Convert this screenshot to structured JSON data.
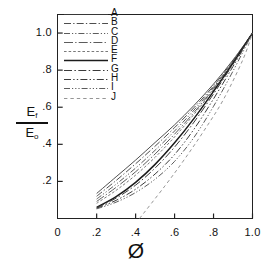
{
  "chart_data": {
    "type": "line",
    "title": "",
    "xlabel": "Ø",
    "ylabel": "E_f / E_o",
    "ylabel_numerator": "E",
    "ylabel_numerator_sub": "f",
    "ylabel_denominator": "E",
    "ylabel_denominator_sub": "o",
    "xlim": [
      0.0,
      1.0
    ],
    "ylim": [
      0.0,
      1.1
    ],
    "grid": false,
    "legend_position": "top-left-inside",
    "xticks": [
      0.0,
      0.2,
      0.4,
      0.6,
      0.8,
      1.0
    ],
    "xticklabels": [
      "0",
      ".2",
      ".4",
      ".6",
      ".8",
      "1.0"
    ],
    "yticks": [
      0.2,
      0.4,
      0.6,
      0.8,
      1.0
    ],
    "yticklabels": [
      ".2",
      ".4",
      ".6",
      ".8",
      "1.0"
    ],
    "series": [
      {
        "name": "A",
        "label": "A",
        "dash": "solid",
        "color": "#3a3a3a",
        "width": 0.9,
        "x": [
          0.2,
          0.3,
          0.4,
          0.5,
          0.6,
          0.7,
          0.8,
          0.9,
          1.0
        ],
        "y": [
          0.135,
          0.225,
          0.315,
          0.41,
          0.505,
          0.61,
          0.725,
          0.855,
          1.0
        ]
      },
      {
        "name": "B",
        "label": "B",
        "dash": "dash-dot",
        "color": "#3a3a3a",
        "width": 0.9,
        "x": [
          0.2,
          0.3,
          0.4,
          0.5,
          0.6,
          0.7,
          0.8,
          0.9,
          1.0
        ],
        "y": [
          0.12,
          0.205,
          0.295,
          0.39,
          0.49,
          0.598,
          0.715,
          0.85,
          1.0
        ]
      },
      {
        "name": "C",
        "label": "C",
        "dash": "dash-dot-dot",
        "color": "#4a4a4a",
        "width": 0.9,
        "x": [
          0.2,
          0.3,
          0.4,
          0.5,
          0.6,
          0.7,
          0.8,
          0.9,
          1.0
        ],
        "y": [
          0.105,
          0.185,
          0.272,
          0.368,
          0.472,
          0.585,
          0.708,
          0.845,
          1.0
        ]
      },
      {
        "name": "D",
        "label": "D",
        "dash": "long-dash-dot",
        "color": "#4a4a4a",
        "width": 0.9,
        "x": [
          0.2,
          0.3,
          0.4,
          0.5,
          0.6,
          0.7,
          0.8,
          0.9,
          1.0
        ],
        "y": [
          0.092,
          0.168,
          0.252,
          0.348,
          0.455,
          0.572,
          0.7,
          0.842,
          1.0
        ]
      },
      {
        "name": "E",
        "label": "E",
        "dash": "fine-dash",
        "color": "#6a6a6a",
        "width": 0.9,
        "x": [
          0.2,
          0.3,
          0.4,
          0.5,
          0.6,
          0.7,
          0.8,
          0.9,
          1.0
        ],
        "y": [
          0.082,
          0.152,
          0.234,
          0.33,
          0.44,
          0.562,
          0.695,
          0.84,
          1.0
        ]
      },
      {
        "name": "F",
        "label": "F",
        "dash": "solid-thick",
        "color": "#1c1c1c",
        "width": 1.5,
        "x": [
          0.2,
          0.3,
          0.4,
          0.5,
          0.6,
          0.7,
          0.8,
          0.9,
          1.0
        ],
        "y": [
          0.06,
          0.118,
          0.195,
          0.292,
          0.408,
          0.54,
          0.686,
          0.838,
          1.0
        ]
      },
      {
        "name": "G",
        "label": "G",
        "dash": "dash-dot-long",
        "color": "#3a3a3a",
        "width": 1.0,
        "x": [
          0.2,
          0.3,
          0.4,
          0.5,
          0.6,
          0.7,
          0.8,
          0.9,
          1.0
        ],
        "y": [
          0.058,
          0.11,
          0.18,
          0.272,
          0.385,
          0.52,
          0.672,
          0.832,
          1.0
        ]
      },
      {
        "name": "H",
        "label": "H",
        "dash": "dash-dot-dot-long",
        "color": "#3a3a3a",
        "width": 1.0,
        "x": [
          0.2,
          0.3,
          0.4,
          0.5,
          0.6,
          0.7,
          0.8,
          0.9,
          1.0
        ],
        "y": [
          0.055,
          0.098,
          0.158,
          0.24,
          0.345,
          0.482,
          0.645,
          0.82,
          1.0
        ]
      },
      {
        "name": "I",
        "label": "I",
        "dash": "dash-dot-dot-dot",
        "color": "#4a4a4a",
        "width": 0.9,
        "x": [
          0.2,
          0.3,
          0.4,
          0.5,
          0.6,
          0.7,
          0.8,
          0.9,
          1.0
        ],
        "y": [
          0.052,
          0.088,
          0.14,
          0.212,
          0.308,
          0.438,
          0.605,
          0.795,
          1.0
        ]
      },
      {
        "name": "J",
        "label": "J",
        "dash": "sparse-dash",
        "color": "#8a8a8a",
        "width": 0.9,
        "x": [
          0.42,
          0.55,
          0.65,
          0.75,
          0.85,
          0.95,
          1.0
        ],
        "y": [
          0.0,
          0.175,
          0.318,
          0.472,
          0.64,
          0.855,
          1.0
        ]
      }
    ]
  },
  "legend": {
    "entries": [
      "A",
      "B",
      "C",
      "D",
      "E",
      "F",
      "G",
      "H",
      "I",
      "J"
    ]
  },
  "axes": {
    "x_tick_labels": [
      "0",
      ".2",
      ".4",
      ".6",
      ".8",
      "1.0"
    ],
    "y_tick_labels": [
      ".2",
      ".4",
      ".6",
      ".8",
      "1.0"
    ],
    "x_title": "Ø",
    "y_num": "E",
    "y_num_sub": "f",
    "y_den": "E",
    "y_den_sub": "o"
  }
}
